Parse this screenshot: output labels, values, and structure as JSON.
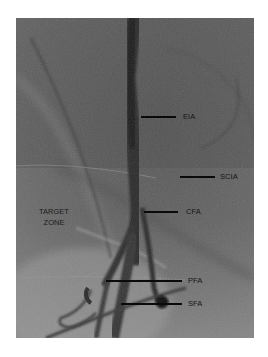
{
  "figure": {
    "type": "angiogram",
    "labels": [
      {
        "id": "eia",
        "text": "EIA"
      },
      {
        "id": "scia",
        "text": "SCIA"
      },
      {
        "id": "cfa",
        "text": "CFA"
      },
      {
        "id": "pfa",
        "text": "PFA"
      },
      {
        "id": "sfa",
        "text": "SFA"
      }
    ],
    "zone": {
      "line1": "TARGET",
      "line2": "ZONE"
    }
  }
}
